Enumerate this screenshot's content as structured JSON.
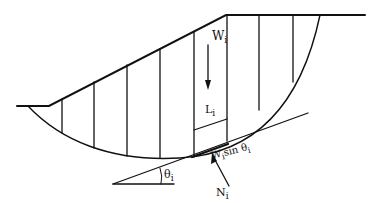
{
  "diagram": {
    "labels": {
      "weight": "W",
      "weight_sub": "i",
      "length": "L",
      "length_sub": "i",
      "shear": "W",
      "shear_sub": "i",
      "shear_rest": "sin θ",
      "shear_rest_sub": "i",
      "normal": "N",
      "normal_sub": "i",
      "angle": "θ",
      "angle_sub": "i"
    },
    "slice_count": 9,
    "colors": {
      "line": "#111111",
      "background": "#ffffff"
    }
  }
}
